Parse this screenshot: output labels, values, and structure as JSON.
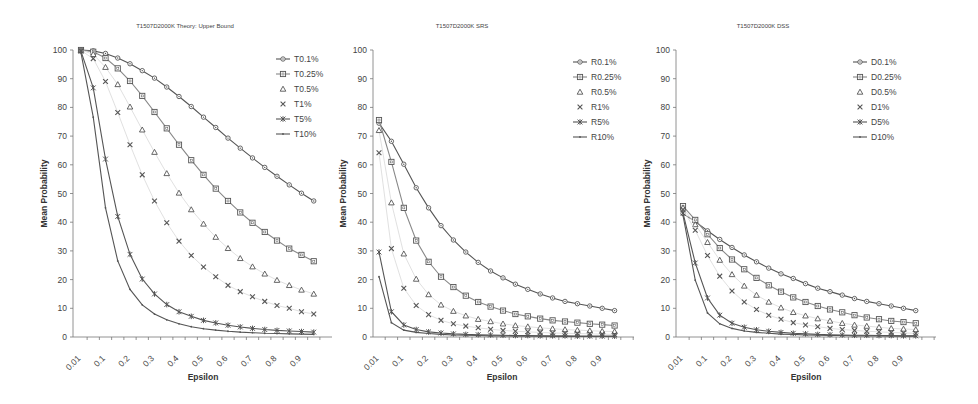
{
  "chart_data": [
    {
      "type": "line",
      "title": "T1507D2000K Theory: Upper Bound",
      "xlabel": "Epsilon",
      "ylabel": "Mean Probability",
      "ylim": [
        0,
        100
      ],
      "yticks": [
        0,
        10,
        20,
        30,
        40,
        50,
        60,
        70,
        80,
        90,
        100
      ],
      "x": [
        0.01,
        0.05,
        0.1,
        0.15,
        0.2,
        0.25,
        0.3,
        0.35,
        0.4,
        0.45,
        0.5,
        0.55,
        0.6,
        0.65,
        0.7,
        0.75,
        0.8,
        0.85,
        0.9,
        0.95,
        1.0
      ],
      "xtick_labels": [
        "0.01",
        "0.1",
        "0.2",
        "0.3",
        "0.4",
        "0.5",
        "0.6",
        "0.7",
        "0.8",
        "0.9"
      ],
      "grid": false,
      "legend_position": "top-right",
      "series": [
        {
          "name": "T0.1%",
          "marker": "diamond",
          "line": true,
          "values": [
            100,
            99.7,
            98.8,
            97.2,
            95.2,
            92.8,
            90.2,
            87.1,
            83.8,
            80.3,
            76.6,
            73.0,
            69.3,
            65.8,
            62.4,
            59.1,
            56.0,
            53.0,
            50.1,
            47.4,
            47.4
          ]
        },
        {
          "name": "T0.25%",
          "marker": "square",
          "line": true,
          "values": [
            100,
            99.4,
            97.2,
            93.6,
            89.2,
            84.0,
            78.4,
            72.7,
            67.0,
            61.6,
            56.5,
            51.7,
            47.4,
            43.4,
            39.8,
            36.6,
            33.6,
            30.8,
            28.6,
            26.4,
            26.4
          ]
        },
        {
          "name": "T0.5%",
          "marker": "triangle",
          "line": false,
          "values": [
            100,
            98.5,
            94.0,
            88.0,
            80.2,
            72.2,
            64.4,
            57.0,
            50.2,
            44.4,
            39.4,
            34.8,
            30.9,
            27.4,
            24.5,
            22.0,
            19.8,
            18.0,
            16.4,
            15.0,
            15.0
          ]
        },
        {
          "name": "T1%",
          "marker": "cross",
          "line": false,
          "values": [
            99.8,
            97.0,
            89.0,
            78.2,
            67.0,
            56.5,
            47.4,
            39.8,
            33.4,
            28.4,
            24.4,
            21.0,
            18.0,
            15.8,
            14.0,
            12.4,
            11.0,
            10.0,
            8.8,
            8.0,
            8.0
          ]
        },
        {
          "name": "T5%",
          "marker": "star",
          "line": true,
          "values": [
            99.5,
            86.8,
            62.0,
            42.0,
            28.8,
            20.2,
            15.0,
            11.3,
            8.8,
            7.2,
            5.8,
            4.9,
            4.1,
            3.5,
            3.0,
            2.6,
            2.3,
            2.1,
            1.9,
            1.7,
            1.7
          ]
        },
        {
          "name": "T10%",
          "marker": "dash",
          "line": true,
          "values": [
            99.0,
            76.6,
            45.0,
            26.5,
            16.6,
            11.2,
            8.0,
            6.0,
            4.6,
            3.6,
            2.9,
            2.4,
            2.0,
            1.7,
            1.5,
            1.3,
            1.2,
            1.1,
            1.0,
            0.9,
            0.9
          ]
        }
      ]
    },
    {
      "type": "line",
      "title": "T1507D2000K SRS",
      "xlabel": "Epsilon",
      "ylabel": "Mean Probability",
      "ylim": [
        0,
        100
      ],
      "yticks": [
        0,
        10,
        20,
        30,
        40,
        50,
        60,
        70,
        80,
        90,
        100
      ],
      "x": [
        0.01,
        0.05,
        0.1,
        0.15,
        0.2,
        0.25,
        0.3,
        0.35,
        0.4,
        0.45,
        0.5,
        0.55,
        0.6,
        0.65,
        0.7,
        0.75,
        0.8,
        0.85,
        0.9,
        0.95,
        1.0
      ],
      "xtick_labels": [
        "0.01",
        "0.1",
        "0.2",
        "0.3",
        "0.4",
        "0.5",
        "0.6",
        "0.7",
        "0.8",
        "0.9"
      ],
      "grid": false,
      "legend_position": "top-right",
      "series": [
        {
          "name": "R0.1%",
          "marker": "diamond",
          "line": true,
          "values": [
            74.5,
            68.2,
            60.2,
            52.0,
            45.0,
            38.8,
            33.8,
            29.6,
            26.0,
            23.0,
            20.6,
            18.4,
            16.6,
            15.0,
            13.6,
            12.4,
            11.6,
            10.8,
            10.0,
            9.2,
            9.2
          ]
        },
        {
          "name": "R0.25%",
          "marker": "square",
          "line": true,
          "values": [
            75.6,
            61.0,
            45.0,
            33.6,
            26.2,
            21.0,
            17.4,
            14.4,
            12.2,
            10.6,
            9.2,
            8.0,
            7.2,
            6.4,
            5.8,
            5.4,
            5.0,
            4.6,
            4.3,
            4.0,
            4.0
          ]
        },
        {
          "name": "R0.5%",
          "marker": "triangle",
          "line": false,
          "values": [
            72.0,
            46.8,
            29.0,
            20.2,
            14.8,
            11.2,
            9.0,
            7.4,
            6.2,
            5.4,
            4.6,
            4.0,
            3.6,
            3.2,
            2.9,
            2.6,
            2.4,
            2.2,
            2.0,
            1.9,
            1.9
          ]
        },
        {
          "name": "R1%",
          "marker": "cross",
          "line": false,
          "values": [
            64.2,
            30.8,
            17.0,
            11.0,
            7.8,
            5.8,
            4.6,
            3.8,
            3.2,
            2.7,
            2.3,
            2.0,
            1.8,
            1.6,
            1.4,
            1.3,
            1.2,
            1.1,
            1.0,
            0.9,
            0.9
          ]
        },
        {
          "name": "R5%",
          "marker": "star",
          "line": true,
          "values": [
            29.6,
            8.8,
            4.2,
            2.6,
            1.8,
            1.4,
            1.1,
            0.9,
            0.8,
            0.7,
            0.6,
            0.5,
            0.5,
            0.4,
            0.4,
            0.4,
            0.3,
            0.3,
            0.3,
            0.3,
            0.3
          ]
        },
        {
          "name": "R10%",
          "marker": "dash",
          "line": true,
          "values": [
            21.0,
            5.0,
            2.4,
            1.6,
            1.2,
            0.9,
            0.7,
            0.6,
            0.5,
            0.4,
            0.4,
            0.3,
            0.3,
            0.3,
            0.2,
            0.2,
            0.2,
            0.2,
            0.2,
            0.2,
            0.2
          ]
        }
      ]
    },
    {
      "type": "line",
      "title": "T1507D2000K DSS",
      "xlabel": "Epsilon",
      "ylabel": "Mean Probability",
      "ylim": [
        0,
        100
      ],
      "yticks": [
        0,
        10,
        20,
        30,
        40,
        50,
        60,
        70,
        80,
        90,
        100
      ],
      "x": [
        0.01,
        0.05,
        0.1,
        0.15,
        0.2,
        0.25,
        0.3,
        0.35,
        0.4,
        0.45,
        0.5,
        0.55,
        0.6,
        0.65,
        0.7,
        0.75,
        0.8,
        0.85,
        0.9,
        0.95,
        1.0
      ],
      "xtick_labels": [
        "0.01",
        "0.1",
        "0.2",
        "0.3",
        "0.4",
        "0.5",
        "0.6",
        "0.7",
        "0.8",
        "0.9"
      ],
      "grid": false,
      "legend_position": "top-right",
      "series": [
        {
          "name": "D0.1%",
          "marker": "diamond",
          "line": true,
          "values": [
            43.0,
            40.2,
            37.0,
            34.0,
            31.2,
            28.6,
            26.2,
            24.0,
            22.0,
            20.4,
            18.6,
            17.0,
            15.8,
            14.6,
            13.4,
            12.4,
            11.6,
            10.8,
            10.0,
            9.2,
            9.2
          ]
        },
        {
          "name": "D0.25%",
          "marker": "square",
          "line": true,
          "values": [
            45.6,
            40.8,
            35.8,
            31.0,
            27.0,
            23.6,
            20.6,
            18.0,
            15.8,
            13.8,
            12.2,
            10.8,
            9.6,
            8.6,
            7.6,
            6.8,
            6.2,
            5.6,
            5.2,
            4.8,
            4.8
          ]
        },
        {
          "name": "D0.5%",
          "marker": "triangle",
          "line": false,
          "values": [
            45.0,
            39.2,
            33.0,
            26.8,
            21.8,
            17.8,
            14.6,
            12.2,
            10.2,
            8.6,
            7.4,
            6.4,
            5.6,
            4.8,
            4.2,
            3.8,
            3.4,
            3.0,
            2.8,
            2.6,
            2.6
          ]
        },
        {
          "name": "D1%",
          "marker": "cross",
          "line": false,
          "values": [
            44.4,
            37.2,
            28.4,
            21.2,
            16.0,
            12.2,
            9.6,
            7.6,
            6.2,
            5.0,
            4.2,
            3.6,
            3.0,
            2.6,
            2.3,
            2.0,
            1.8,
            1.6,
            1.4,
            1.3,
            1.3
          ]
        },
        {
          "name": "D5%",
          "marker": "star",
          "line": true,
          "values": [
            43.2,
            25.8,
            13.6,
            7.6,
            4.8,
            3.4,
            2.5,
            2.0,
            1.6,
            1.3,
            1.1,
            0.9,
            0.8,
            0.7,
            0.6,
            0.6,
            0.5,
            0.5,
            0.4,
            0.4,
            0.4
          ]
        },
        {
          "name": "D10%",
          "marker": "dash",
          "line": true,
          "values": [
            42.4,
            19.8,
            8.4,
            4.6,
            3.0,
            2.1,
            1.6,
            1.3,
            1.0,
            0.9,
            0.7,
            0.6,
            0.5,
            0.5,
            0.4,
            0.4,
            0.4,
            0.3,
            0.3,
            0.3,
            0.3
          ]
        }
      ]
    }
  ],
  "layout": {
    "charts": [
      {
        "title_x": 185,
        "title_y": 28,
        "axis_x": 73,
        "plot_right": 332,
        "y0": 337,
        "y100": 50,
        "first_x": 81,
        "step": 12.25,
        "ylabel_x": 47,
        "xlabel_x": 203,
        "legend_x": 276,
        "legend_y": 59
      },
      {
        "title_x": 462,
        "title_y": 28,
        "axis_x": 373,
        "plot_right": 634,
        "y0": 337,
        "y100": 50,
        "first_x": 379,
        "step": 12.4,
        "ylabel_x": 346,
        "xlabel_x": 502,
        "legend_x": 573,
        "legend_y": 62
      },
      {
        "title_x": 763,
        "title_y": 28,
        "axis_x": 676,
        "plot_right": 936,
        "y0": 337,
        "y100": 50,
        "first_x": 683,
        "step": 12.25,
        "ylabel_x": 650,
        "xlabel_x": 806,
        "legend_x": 853,
        "legend_y": 62
      }
    ],
    "line_colors": [
      "#555555",
      "#888888",
      "#aaaaaa",
      "#aaaaaa",
      "#555555",
      "#555555"
    ],
    "marker_color": "#555555"
  }
}
